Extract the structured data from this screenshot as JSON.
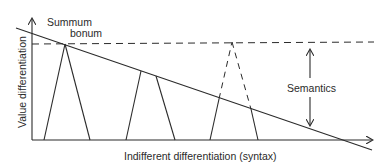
{
  "diagram": {
    "labels": {
      "summum": "Summum",
      "bonum": "bonum",
      "semantics": "Semantics",
      "x_axis": "Indifferent differentiation (syntax)",
      "y_axis": "Value differentiation"
    },
    "colors": {
      "line": "#2b2b2b",
      "background": "#ffffff"
    },
    "elements": {
      "y_axis": {
        "x": 32,
        "y_from": 140,
        "y_to": 18
      },
      "x_axis": {
        "y": 140,
        "x_from": 32,
        "x_to": 372
      },
      "declining_line": {
        "from": [
          16,
          28
        ],
        "to": [
          372,
          150
        ]
      },
      "dashed_level": {
        "y": 44,
        "x_from": 32,
        "x_to": 372
      },
      "triangles": [
        {
          "name": "summum-bonum",
          "apex": [
            65,
            43
          ],
          "base": [
            [
              44,
              140
            ],
            [
              90,
              140
            ]
          ],
          "style": "solid"
        },
        {
          "name": "middle",
          "left": [
            [
              126,
              140
            ],
            [
              141,
              70
            ]
          ],
          "right": [
            [
              156,
              75
            ],
            [
              175,
              140
            ]
          ],
          "style": "solid"
        },
        {
          "name": "right",
          "left": [
            [
              210,
              140
            ],
            [
              219,
              99
            ]
          ],
          "right": [
            [
              250,
              110
            ],
            [
              258,
              140
            ]
          ],
          "apex": [
            232,
            42
          ],
          "style": "solid-with-dashed-apex"
        }
      ],
      "semantics_arrow": {
        "x": 310,
        "up": [
          78,
          49
        ],
        "down": [
          97,
          126
        ]
      }
    }
  }
}
